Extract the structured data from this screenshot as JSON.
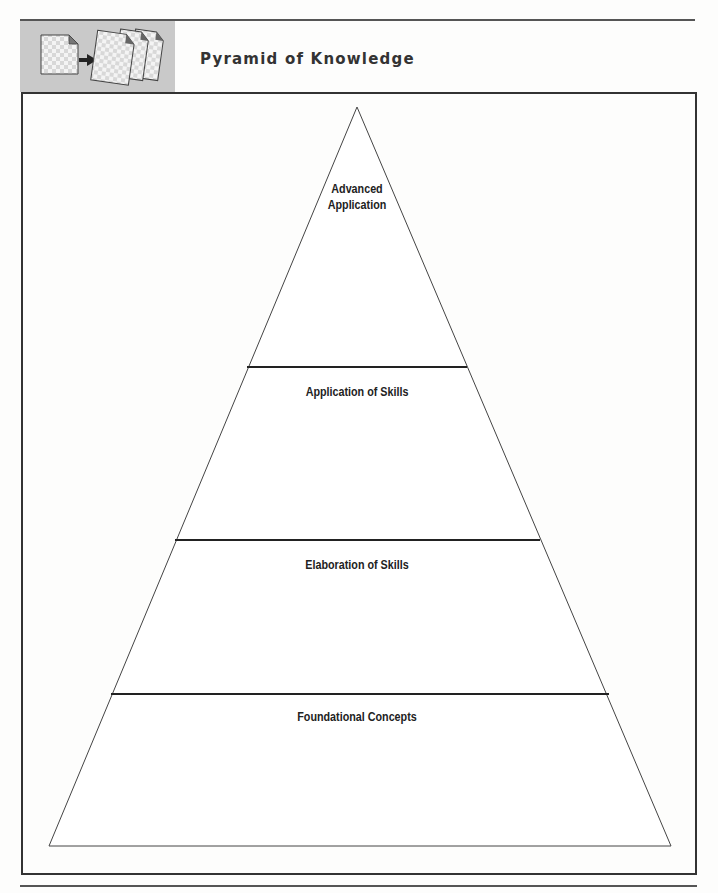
{
  "header": {
    "title": "Pyramid of Knowledge",
    "icon": "document-to-copies-icon",
    "icon_block_color": "#c9c9c9"
  },
  "pyramid": {
    "levels": [
      {
        "label_line1": "Advanced",
        "label_line2": "Application",
        "position": "top"
      },
      {
        "label": "Application of Skills",
        "position": "second"
      },
      {
        "label": "Elaboration of Skills",
        "position": "third"
      },
      {
        "label": "Foundational Concepts",
        "position": "base"
      }
    ],
    "line_color": "#333333"
  }
}
